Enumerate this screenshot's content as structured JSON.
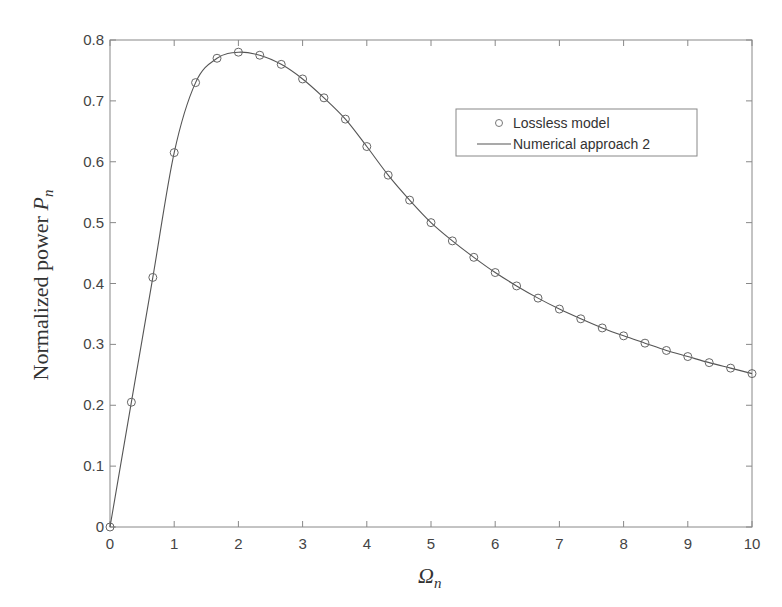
{
  "top_caption_fragment": "",
  "chart_data": {
    "type": "line",
    "title": "",
    "xlabel": "Ω_n",
    "ylabel": "Normalized power P_n",
    "xlim": [
      0,
      10
    ],
    "ylim": [
      0,
      0.8
    ],
    "xticks": [
      0,
      1,
      2,
      3,
      4,
      5,
      6,
      7,
      8,
      9,
      10
    ],
    "yticks": [
      0,
      0.1,
      0.2,
      0.3,
      0.4,
      0.5,
      0.6,
      0.7,
      0.8
    ],
    "ytick_labels": [
      "0",
      "0.1",
      "0.2",
      "0.3",
      "0.4",
      "0.5",
      "0.6",
      "0.7",
      "0.8"
    ],
    "grid": false,
    "legend_position": "upper right",
    "series": [
      {
        "name": "Lossless model",
        "style": "markers",
        "marker": "circle",
        "x": [
          0,
          0.333,
          0.667,
          1,
          1.333,
          1.667,
          2,
          2.333,
          2.667,
          3,
          3.333,
          3.667,
          4,
          4.333,
          4.667,
          5,
          5.333,
          5.667,
          6,
          6.333,
          6.667,
          7,
          7.333,
          7.667,
          8,
          8.333,
          8.667,
          9,
          9.333,
          9.667,
          10
        ],
        "values": [
          0,
          0.205,
          0.41,
          0.615,
          0.73,
          0.77,
          0.78,
          0.775,
          0.76,
          0.736,
          0.705,
          0.67,
          0.625,
          0.578,
          0.537,
          0.5,
          0.47,
          0.443,
          0.418,
          0.396,
          0.376,
          0.358,
          0.342,
          0.327,
          0.314,
          0.302,
          0.29,
          0.28,
          0.27,
          0.261,
          0.252
        ]
      },
      {
        "name": "Numerical approach 2",
        "style": "line",
        "x": [
          0,
          0.333,
          0.667,
          1,
          1.333,
          1.667,
          2,
          2.333,
          2.667,
          3,
          3.333,
          3.667,
          4,
          4.333,
          4.667,
          5,
          5.333,
          5.667,
          6,
          6.333,
          6.667,
          7,
          7.333,
          7.667,
          8,
          8.333,
          8.667,
          9,
          9.333,
          9.667,
          10
        ],
        "values": [
          0,
          0.205,
          0.41,
          0.615,
          0.73,
          0.77,
          0.78,
          0.775,
          0.76,
          0.736,
          0.705,
          0.67,
          0.625,
          0.578,
          0.537,
          0.5,
          0.47,
          0.443,
          0.418,
          0.396,
          0.376,
          0.358,
          0.342,
          0.327,
          0.314,
          0.302,
          0.29,
          0.28,
          0.27,
          0.261,
          0.252
        ]
      }
    ]
  },
  "axes": {
    "xlabel_main": "Ω",
    "xlabel_sub": "n",
    "ylabel_main": "Normalized power ",
    "ylabel_var": "P",
    "ylabel_sub": "n"
  },
  "legend": {
    "items": [
      {
        "label": "Lossless model",
        "symbol": "circle-marker"
      },
      {
        "label": "Numerical approach 2",
        "symbol": "line"
      }
    ]
  },
  "colors": {
    "axis": "#777777",
    "line": "#555555",
    "marker": "#666666",
    "text": "#444444"
  }
}
